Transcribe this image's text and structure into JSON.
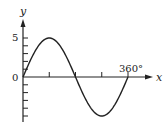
{
  "chart_data": {
    "type": "line",
    "title": "",
    "xlabel": "x",
    "ylabel": "y",
    "x": [
      0,
      45,
      90,
      135,
      180,
      225,
      270,
      315,
      360
    ],
    "series": [
      {
        "name": "y = 5 sin x",
        "values": [
          0,
          3.54,
          5,
          3.54,
          0,
          -3.54,
          -5,
          -3.54,
          0
        ]
      }
    ],
    "x_ticks": [
      90,
      180,
      270,
      360
    ],
    "x_tick_labels": [
      "",
      "",
      "",
      "360°"
    ],
    "y_tick_labels": [
      "5",
      "0"
    ],
    "y_ticks_minor": [
      5,
      4,
      3,
      2,
      1,
      -1,
      -2,
      -3,
      -4,
      -5
    ],
    "xlim": [
      0,
      400
    ],
    "ylim": [
      -5.5,
      6
    ],
    "grid": false,
    "legend": "none"
  },
  "labels": {
    "y_axis": "y",
    "x_axis": "x",
    "y_five": "5",
    "origin": "0",
    "x_360": "360°"
  },
  "colors": {
    "curve": "#222222",
    "axes": "#222222",
    "background": "#ffffff"
  }
}
